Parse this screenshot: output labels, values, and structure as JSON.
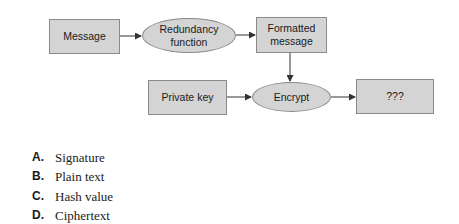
{
  "diagram": {
    "nodes": [
      {
        "id": "message",
        "label": "Message",
        "shape": "rect"
      },
      {
        "id": "redundancy",
        "label": "Redundancy function",
        "shape": "ellipse"
      },
      {
        "id": "formatted",
        "label": "Formatted message",
        "shape": "rect"
      },
      {
        "id": "private_key",
        "label": "Private key",
        "shape": "rect"
      },
      {
        "id": "encrypt",
        "label": "Encrypt",
        "shape": "ellipse"
      },
      {
        "id": "unknown",
        "label": "???",
        "shape": "rect"
      }
    ],
    "edges": [
      {
        "from": "message",
        "to": "redundancy"
      },
      {
        "from": "redundancy",
        "to": "formatted"
      },
      {
        "from": "formatted",
        "to": "encrypt"
      },
      {
        "from": "private_key",
        "to": "encrypt"
      },
      {
        "from": "encrypt",
        "to": "unknown"
      }
    ],
    "colors": {
      "node_fill": "#d4d4d4",
      "node_border": "#8a8a8a",
      "edge": "#333333"
    }
  },
  "options": [
    {
      "letter": "A.",
      "text": "Signature"
    },
    {
      "letter": "B.",
      "text": "Plain text"
    },
    {
      "letter": "C.",
      "text": "Hash value"
    },
    {
      "letter": "D.",
      "text": "Ciphertext"
    }
  ]
}
